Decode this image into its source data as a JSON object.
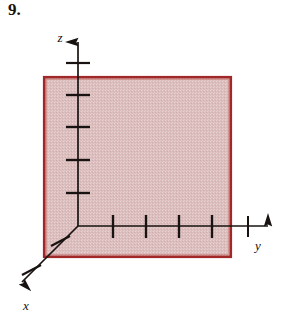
{
  "problem": {
    "number": "9."
  },
  "figure": {
    "name": "3d-coordinate-axes-shaded-plane",
    "background_color": "#ffffff",
    "axis_color": "#181310",
    "region": {
      "name": "shaded-rectangle",
      "border_color": "#a02828",
      "fill_color": "#dcbdbd",
      "x_left": 43,
      "y_top": 76,
      "x_right": 232,
      "y_bottom": 258
    },
    "origin": {
      "x": 78,
      "y": 226
    },
    "axes": [
      {
        "id": "z",
        "label": "z",
        "label_x": 60,
        "label_y": 42,
        "direction": "up",
        "tip": {
          "x": 78,
          "y": 30
        },
        "tick_count": 5,
        "ticks": [
          63,
          95,
          127,
          160,
          193
        ]
      },
      {
        "id": "y",
        "label": "y",
        "label_x": 258,
        "label_y": 248,
        "direction": "right",
        "tip": {
          "x": 280,
          "y": 226
        },
        "tick_count": 5,
        "ticks": [
          113,
          146,
          179,
          212,
          248
        ]
      },
      {
        "id": "x",
        "label": "x",
        "label_x": 24,
        "label_y": 308,
        "direction": "down-left-diagonal",
        "tip": {
          "x": 10,
          "y": 290
        },
        "tick_count": 2,
        "ticks": [
          {
            "x": 59,
            "y": 241
          },
          {
            "x": 30,
            "y": 270
          }
        ]
      }
    ]
  }
}
